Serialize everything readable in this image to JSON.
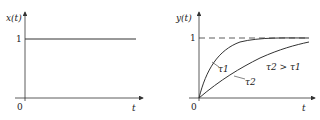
{
  "left_plot": {
    "y_label": "x(t)",
    "x_label": "t",
    "origin": "0",
    "level_label": "1",
    "description": "unit step input"
  },
  "right_plot": {
    "y_label": "y(t)",
    "x_label": "t",
    "origin": "0",
    "level_label": "1",
    "curve1_label": "τ1",
    "curve2_label": "τ2",
    "relation": "τ2 > τ1",
    "description": "first-order step responses with different time constants"
  },
  "colors": {
    "line": "#333333",
    "background": "#ffffff"
  }
}
